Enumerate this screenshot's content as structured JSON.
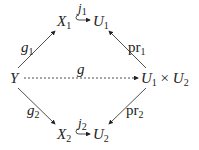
{
  "diagram": {
    "type": "commutative-diagram",
    "nodes": {
      "X1": {
        "base": "X",
        "sub": "1"
      },
      "U1": {
        "base": "U",
        "sub": "1"
      },
      "Y": {
        "base": "Y"
      },
      "U1xU2": {
        "base1": "U",
        "sub1": "1",
        "times": "×",
        "base2": "U",
        "sub2": "2"
      },
      "X2": {
        "base": "X",
        "sub": "2"
      },
      "U2": {
        "base": "U",
        "sub": "2"
      }
    },
    "arrows": {
      "g1": {
        "base": "g",
        "sub": "1",
        "from": "Y",
        "to": "X1",
        "style": "solid"
      },
      "j1": {
        "base": "j",
        "sub": "1",
        "from": "X1",
        "to": "U1",
        "style": "hook"
      },
      "pr1": {
        "base": "pr",
        "sub": "1",
        "from": "U1xU2",
        "to": "U1",
        "style": "solid"
      },
      "g": {
        "base": "g",
        "from": "Y",
        "to": "U1xU2",
        "style": "dashed"
      },
      "g2": {
        "base": "g",
        "sub": "2",
        "from": "Y",
        "to": "X2",
        "style": "solid"
      },
      "j2": {
        "base": "j",
        "sub": "2",
        "from": "X2",
        "to": "U2",
        "style": "hook"
      },
      "pr2": {
        "base": "pr",
        "sub": "2",
        "from": "U1xU2",
        "to": "U2",
        "style": "solid"
      }
    }
  }
}
